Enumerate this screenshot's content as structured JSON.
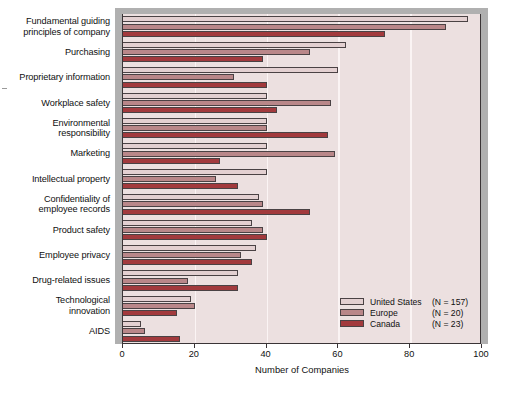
{
  "chart_data": {
    "type": "bar",
    "orientation": "horizontal",
    "title": "",
    "xlabel": "Number of Companies",
    "ylabel": "",
    "xlim": [
      0,
      100
    ],
    "xticks": [
      0,
      20,
      40,
      60,
      80,
      100
    ],
    "grid": "vertical",
    "legend_position": "bottom-right",
    "categories": [
      "Fundamental guiding principles of company",
      "Purchasing",
      "Proprietary information",
      "Workplace safety",
      "Environmental responsibility",
      "Marketing",
      "Intellectual property",
      "Confidentiality of employee records",
      "Product safety",
      "Employee privacy",
      "Drug-related issues",
      "Technological innovation",
      "AIDS"
    ],
    "series": [
      {
        "name": "United States",
        "n_label": "(N = 157)",
        "color": "#e3d0d1",
        "values": [
          96,
          62,
          60,
          40,
          40,
          40,
          40,
          38,
          36,
          37,
          32,
          19,
          5
        ]
      },
      {
        "name": "Europe",
        "n_label": "(N = 20)",
        "color": "#b98789",
        "values": [
          90,
          52,
          31,
          58,
          40,
          59,
          26,
          39,
          39,
          33,
          18,
          20,
          6
        ]
      },
      {
        "name": "Canada",
        "n_label": "(N = 23)",
        "color": "#a23a3d",
        "values": [
          73,
          39,
          40,
          43,
          57,
          27,
          32,
          52,
          40,
          36,
          32,
          15,
          16
        ]
      }
    ]
  },
  "category_lines": [
    [
      "Fundamental guiding",
      "principles of company"
    ],
    [
      "Purchasing"
    ],
    [
      "Proprietary information"
    ],
    [
      "Workplace safety"
    ],
    [
      "Environmental",
      "responsibility"
    ],
    [
      "Marketing"
    ],
    [
      "Intellectual property"
    ],
    [
      "Confidentiality of",
      "employee records"
    ],
    [
      "Product safety"
    ],
    [
      "Employee privacy"
    ],
    [
      "Drug-related issues"
    ],
    [
      "Technological",
      "innovation"
    ],
    [
      "AIDS"
    ]
  ],
  "colors": {
    "united_states": "#e3d0d1",
    "europe": "#b98789",
    "canada": "#a23a3d",
    "plot_background": "#ece0e0",
    "frame": "#b0b0b0",
    "gridline": "#fbf4f4",
    "axis": "#3a3436"
  }
}
